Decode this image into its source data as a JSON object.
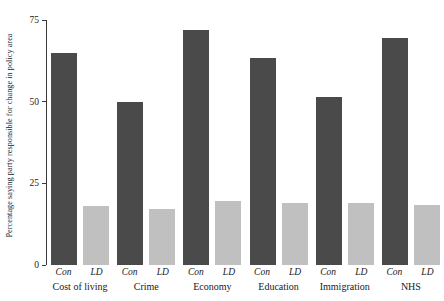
{
  "chart_data": {
    "type": "bar",
    "title": "",
    "subtitle": "",
    "xlabel": "",
    "ylabel": "Percentage saying party responsible for change in policy area",
    "ylim": [
      0,
      75
    ],
    "yticks": [
      0,
      25,
      50,
      75
    ],
    "ytick_labels": [
      "0",
      "25",
      "50",
      "75"
    ],
    "grid": false,
    "legend": "none",
    "categories": [
      "Cost of living",
      "Crime",
      "Economy",
      "Education",
      "Immigration",
      "NHS"
    ],
    "series": [
      {
        "name": "Con",
        "color": "#4a4a4a",
        "values": [
          65,
          50,
          72,
          63.5,
          51.5,
          69.5
        ]
      },
      {
        "name": "LD",
        "color": "#c0c0c0",
        "values": [
          18,
          17,
          19.5,
          19,
          19,
          18.5
        ]
      }
    ],
    "series_labels": [
      "Con",
      "LD"
    ]
  },
  "axis": {
    "tick_0": "0",
    "tick_25": "25",
    "tick_50": "50",
    "tick_75": "75",
    "y_title": "Percentage saying party responsible for change in policy area"
  },
  "groups": [
    {
      "label": "Cost of living",
      "con_label": "Con",
      "ld_label": "LD",
      "con_value": "65",
      "ld_value": "18"
    },
    {
      "label": "Crime",
      "con_label": "Con",
      "ld_label": "LD",
      "con_value": "50",
      "ld_value": "17"
    },
    {
      "label": "Economy",
      "con_label": "Con",
      "ld_label": "LD",
      "con_value": "72",
      "ld_value": "19.5"
    },
    {
      "label": "Education",
      "con_label": "Con",
      "ld_label": "LD",
      "con_value": "63.5",
      "ld_value": "19"
    },
    {
      "label": "Immigration",
      "con_label": "Con",
      "ld_label": "LD",
      "con_value": "51.5",
      "ld_value": "19"
    },
    {
      "label": "NHS",
      "con_label": "Con",
      "ld_label": "LD",
      "con_value": "69.5",
      "ld_value": "18.5"
    }
  ],
  "colors": {
    "con_bar": "#4a4a4a",
    "ld_bar": "#c0c0c0",
    "axis": "#3a3a3a",
    "background": "#ffffff"
  }
}
